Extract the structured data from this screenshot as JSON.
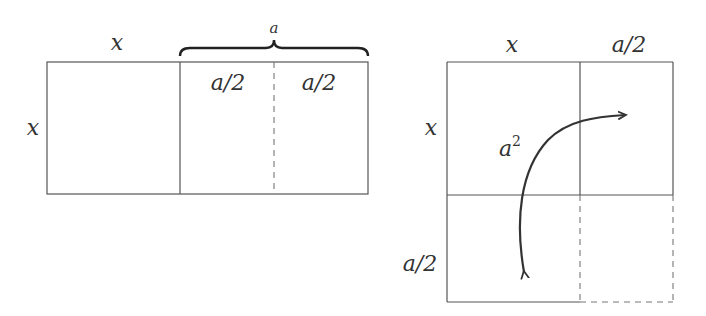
{
  "left_figure": {
    "top_label_x": "x",
    "side_label_x": "x",
    "brace_label": "a",
    "inner_label_left": "a/2",
    "inner_label_right": "a/2"
  },
  "right_figure": {
    "top_label_x": "x",
    "top_label_half": "a/2",
    "side_label_x": "x",
    "side_label_half": "a/2",
    "area_label_base": "a",
    "area_label_exp": "2"
  },
  "colors": {
    "stroke": "#555555",
    "dashed": "#777777",
    "arrow": "#333333",
    "text": "#333333"
  }
}
